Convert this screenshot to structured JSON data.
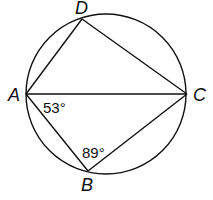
{
  "diagram": {
    "circle": {
      "cx": 106,
      "cy": 94,
      "r": 80
    },
    "points": {
      "A": {
        "label": "A",
        "x": 26,
        "y": 94
      },
      "B": {
        "label": "B",
        "x": 88,
        "y": 171
      },
      "C": {
        "label": "C",
        "x": 187,
        "y": 94
      },
      "D": {
        "label": "D",
        "x": 82,
        "y": 19
      }
    },
    "segments": [
      "AD",
      "DC",
      "AC",
      "AB",
      "BC"
    ],
    "angles": {
      "A": {
        "label": "53°",
        "at": "A",
        "between": "AC-AB"
      },
      "B": {
        "label": "89°",
        "at": "B",
        "between": "BA-BC"
      }
    },
    "stroke_color": "#111111"
  }
}
